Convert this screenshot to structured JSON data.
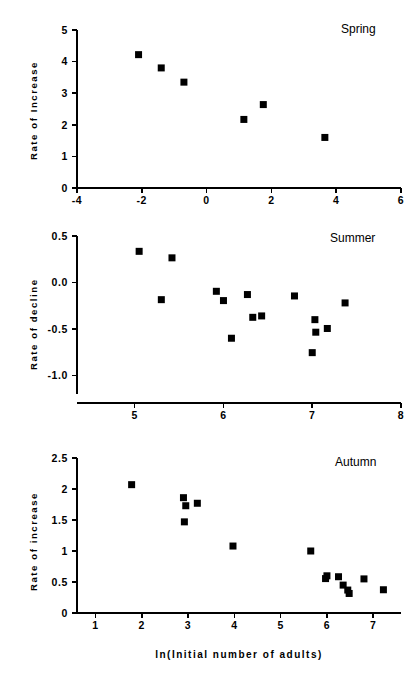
{
  "figure": {
    "background": "#ffffff",
    "foreground": "#000000",
    "x_axis_title": "ln(Initial number of adults)",
    "marker_color": "#000000",
    "marker_shape": "square"
  },
  "panels": [
    {
      "key": "spring",
      "title": "Spring",
      "ylabel": "Rate of Increase",
      "x_ticks": [
        "-4",
        "-2",
        "0",
        "2",
        "4",
        "6"
      ],
      "y_ticks": [
        "0",
        "1",
        "2",
        "3",
        "4",
        "5"
      ]
    },
    {
      "key": "summer",
      "title": "Summer",
      "ylabel": "Rate of decline",
      "x_ticks": [
        "5",
        "6",
        "7",
        "8"
      ],
      "y_ticks": [
        "-1.0",
        "-0.5",
        "0.0",
        "0.5"
      ]
    },
    {
      "key": "autumn",
      "title": "Autumn",
      "ylabel": "Rate of increase",
      "x_ticks": [
        "1",
        "2",
        "3",
        "4",
        "5",
        "6",
        "7"
      ],
      "y_ticks": [
        "0",
        "0.5",
        "1",
        "1.5",
        "2",
        "2.5"
      ]
    }
  ],
  "chart_data": [
    {
      "type": "scatter",
      "title": "Spring",
      "xlabel": "ln(Initial number of adults)",
      "ylabel": "Rate of Increase",
      "xlim": [
        -4,
        6
      ],
      "ylim": [
        0,
        5
      ],
      "xticks": [
        -4,
        -2,
        0,
        2,
        4,
        6
      ],
      "yticks": [
        0,
        1,
        2,
        3,
        4,
        5
      ],
      "grid": false,
      "legend": "none",
      "points": [
        {
          "x": -2.1,
          "y": 4.22
        },
        {
          "x": -1.4,
          "y": 3.8
        },
        {
          "x": -0.7,
          "y": 3.35
        },
        {
          "x": 1.15,
          "y": 2.17
        },
        {
          "x": 1.75,
          "y": 2.64
        },
        {
          "x": 3.65,
          "y": 1.6
        }
      ]
    },
    {
      "type": "scatter",
      "title": "Summer",
      "xlabel": "ln(Initial number of adults)",
      "ylabel": "Rate of decline",
      "xlim": [
        4.35,
        8
      ],
      "ylim": [
        -1.2,
        0.5
      ],
      "xticks": [
        5,
        6,
        7,
        8
      ],
      "yticks": [
        -1.0,
        -0.5,
        0.0,
        0.5
      ],
      "grid": false,
      "legend": "none",
      "points": [
        {
          "x": 5.05,
          "y": 0.335
        },
        {
          "x": 5.42,
          "y": 0.265
        },
        {
          "x": 5.3,
          "y": -0.185
        },
        {
          "x": 5.92,
          "y": -0.095
        },
        {
          "x": 6.0,
          "y": -0.195
        },
        {
          "x": 6.09,
          "y": -0.6
        },
        {
          "x": 6.27,
          "y": -0.13
        },
        {
          "x": 6.33,
          "y": -0.375
        },
        {
          "x": 6.43,
          "y": -0.36
        },
        {
          "x": 6.8,
          "y": -0.145
        },
        {
          "x": 7.0,
          "y": -0.755
        },
        {
          "x": 7.03,
          "y": -0.4
        },
        {
          "x": 7.04,
          "y": -0.535
        },
        {
          "x": 7.17,
          "y": -0.495
        },
        {
          "x": 7.37,
          "y": -0.22
        }
      ]
    },
    {
      "type": "scatter",
      "title": "Autumn",
      "xlabel": "ln(Initial number of adults)",
      "ylabel": "Rate of increase",
      "xlim": [
        0.6,
        7.6
      ],
      "ylim": [
        0,
        2.5
      ],
      "xticks": [
        1,
        2,
        3,
        4,
        5,
        6,
        7
      ],
      "yticks": [
        0,
        0.5,
        1,
        1.5,
        2,
        2.5
      ],
      "grid": false,
      "legend": "none",
      "points": [
        {
          "x": 1.78,
          "y": 2.07
        },
        {
          "x": 2.9,
          "y": 1.86
        },
        {
          "x": 2.95,
          "y": 1.73
        },
        {
          "x": 2.92,
          "y": 1.47
        },
        {
          "x": 3.2,
          "y": 1.77
        },
        {
          "x": 3.97,
          "y": 1.08
        },
        {
          "x": 5.65,
          "y": 1.0
        },
        {
          "x": 5.97,
          "y": 0.555
        },
        {
          "x": 6.0,
          "y": 0.6
        },
        {
          "x": 6.25,
          "y": 0.585
        },
        {
          "x": 6.35,
          "y": 0.45
        },
        {
          "x": 6.45,
          "y": 0.37
        },
        {
          "x": 6.48,
          "y": 0.315
        },
        {
          "x": 6.8,
          "y": 0.55
        },
        {
          "x": 7.22,
          "y": 0.375
        }
      ]
    }
  ]
}
